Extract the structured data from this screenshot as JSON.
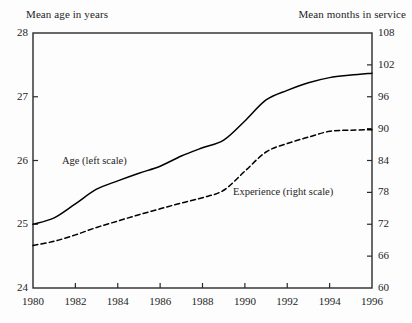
{
  "chart_data": {
    "type": "line",
    "title": "",
    "xlabel": "",
    "ylabel": "Mean age in years",
    "y2label": "Mean months in service",
    "x": [
      1980,
      1981,
      1982,
      1983,
      1984,
      1985,
      1986,
      1987,
      1988,
      1989,
      1990,
      1991,
      1992,
      1993,
      1994,
      1995,
      1996
    ],
    "xlim": [
      1980,
      1996
    ],
    "ylim": [
      24,
      28
    ],
    "y2lim": [
      60,
      108
    ],
    "xticks": [
      1980,
      1982,
      1984,
      1986,
      1988,
      1990,
      1992,
      1994,
      1996
    ],
    "xtick_labels": [
      "1980",
      "1982",
      "1984",
      "1986",
      "1988",
      "1990",
      "1992",
      "1994",
      "1996"
    ],
    "yticks": [
      24,
      25,
      26,
      27,
      28
    ],
    "ytick_labels": [
      "24",
      "25",
      "26",
      "27",
      "28"
    ],
    "y2ticks": [
      60,
      66,
      72,
      78,
      84,
      90,
      96,
      102,
      108
    ],
    "y2tick_labels": [
      "60",
      "66",
      "72",
      "78",
      "84",
      "90",
      "96",
      "102",
      "108"
    ],
    "grid": false,
    "legend": "inline-annotations",
    "series": [
      {
        "name": "Age (left scale)",
        "axis": "left",
        "style": "solid",
        "color": "#000000",
        "values": [
          25.0,
          25.1,
          25.32,
          25.55,
          25.68,
          25.8,
          25.91,
          26.07,
          26.2,
          26.32,
          26.62,
          26.95,
          27.1,
          27.22,
          27.3,
          27.34,
          27.37
        ]
      },
      {
        "name": "Experience (right scale)",
        "axis": "right",
        "style": "dashed",
        "color": "#000000",
        "values": [
          68.0,
          68.8,
          70.0,
          71.4,
          72.6,
          73.8,
          74.9,
          76.0,
          77.0,
          78.4,
          82.0,
          85.6,
          87.2,
          88.4,
          89.5,
          89.7,
          89.8
        ]
      }
    ],
    "annotations": [
      {
        "text": "Age (left scale)",
        "x": 1982.9,
        "y": 26.05
      },
      {
        "text": "Experience (right scale)",
        "x": 1989.4,
        "y": 25.55
      }
    ]
  },
  "axis_titles": {
    "left": "Mean age in years",
    "right": "Mean months in service"
  },
  "colors": {
    "background": "#fdfdfd",
    "axis": "#2a2a2a",
    "series": "#000000",
    "text": "#242424"
  }
}
